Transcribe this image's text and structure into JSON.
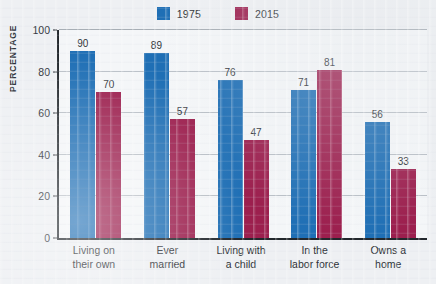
{
  "chart_data": {
    "type": "bar",
    "title": "",
    "subtitle": "",
    "xlabel": "",
    "ylabel": "PERCENTAGE",
    "ylim": [
      0,
      100
    ],
    "yticks": [
      0,
      20,
      40,
      60,
      80,
      100
    ],
    "ytick_labels": [
      "0",
      "20",
      "40",
      "60",
      "80",
      "100"
    ],
    "grid": true,
    "legend_position": "top-center",
    "categories": [
      "Living on their own",
      "Ever married",
      "Living with a child",
      "In the labor force",
      "Owns a home"
    ],
    "category_lines": [
      [
        "Living on",
        "their own"
      ],
      [
        "Ever",
        "married"
      ],
      [
        "Living with",
        "a child"
      ],
      [
        "In the",
        "labor force"
      ],
      [
        "Owns a",
        "home"
      ]
    ],
    "series": [
      {
        "name": "1975",
        "color": "#1f6fb5",
        "values": [
          90,
          89,
          76,
          71,
          56
        ]
      },
      {
        "name": "2015",
        "color": "#9c1f4e",
        "values": [
          70,
          57,
          47,
          81,
          33
        ]
      }
    ]
  },
  "legend": {
    "items": [
      {
        "label": "1975",
        "color": "#1f6fb5"
      },
      {
        "label": "2015",
        "color": "#9c1f4e"
      }
    ]
  },
  "axes": {
    "y_title": "PERCENTAGE",
    "y_ticks": [
      "100",
      "80",
      "60",
      "40",
      "20",
      "0"
    ]
  }
}
